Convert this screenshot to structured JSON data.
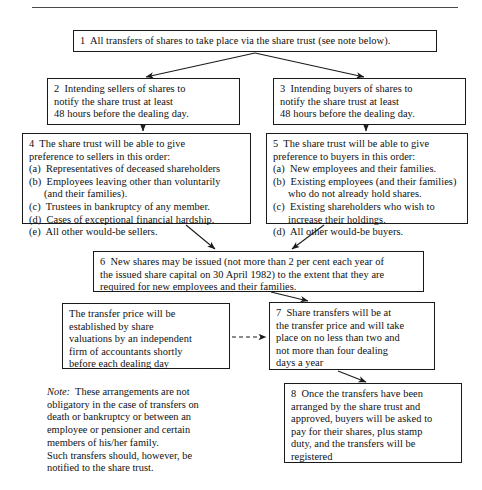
{
  "diagram": {
    "title_rule": "horizontal-rule",
    "boxes": {
      "box1": {
        "id": "1",
        "lines": [
          "1  All transfers of shares to take place via the share trust (see note below)."
        ]
      },
      "box2": {
        "id": "2",
        "lines": [
          "2  Intending sellers of shares to",
          "notify the share trust at least",
          "48 hours before the dealing day."
        ]
      },
      "box3": {
        "id": "3",
        "lines": [
          "3  Intending buyers of shares to",
          "notify the share trust at least",
          "48 hours before the dealing day."
        ]
      },
      "box4": {
        "id": "4",
        "lines": [
          "4  The share trust will be able to give",
          "preference to sellers in this order:",
          "(a)  Representatives of deceased shareholders",
          "(b)  Employees leaving other than voluntarily",
          "(and their families).",
          "(c)  Trustees in bankruptcy of any member.",
          "(d)  Cases of exceptional financial hardship.",
          "(e)  All other would-be sellers."
        ]
      },
      "box5": {
        "id": "5",
        "lines": [
          "5  The share trust will be able to give",
          "preference to buyers in this order:",
          "(a)  New employees and their families.",
          "(b)  Existing employees (and their families)",
          "who do not already hold shares.",
          "(c)  Existing shareholders who wish to",
          "increase their holdings.",
          "(d)  All other would-be buyers."
        ]
      },
      "box6": {
        "id": "6",
        "lines": [
          "6  New shares may be issued (not more than 2 per cent each year of",
          "the issued share capital on 30 April 1982) to the extent that they are",
          "required for new employees and their families."
        ]
      },
      "box_price": {
        "id": "",
        "lines": [
          "The transfer price will be",
          "established by share",
          "valuations by an independent",
          "firm of accountants shortly",
          "before each dealing day"
        ]
      },
      "box7": {
        "id": "7",
        "lines": [
          "7  Share transfers will be at",
          "the transfer price and will take",
          "place on no less than two and",
          "not more than four dealing",
          "days a year"
        ]
      },
      "box8": {
        "id": "8",
        "lines": [
          "8  Once the transfers have been",
          "arranged by the share trust and",
          "approved, buyers will be asked to",
          "pay for their shares, plus stamp",
          "duty, and the transfers will be",
          "registered"
        ]
      }
    },
    "note": {
      "label": "Note:",
      "lines": [
        "  These arrangements are not",
        "obligatory in the case of transfers on",
        "death or bankruptcy or between an",
        "employee or pensioner and certain",
        "members of his/her family.",
        "Such transfers should, however, be",
        "notified to the share trust."
      ]
    },
    "connectors": [
      {
        "name": "arrow-box1-to-box2",
        "style": "solid"
      },
      {
        "name": "arrow-box1-to-box3",
        "style": "solid"
      },
      {
        "name": "arrow-box2-to-box4",
        "style": "solid"
      },
      {
        "name": "arrow-box3-to-box5",
        "style": "solid"
      },
      {
        "name": "arrow-box4-to-box6",
        "style": "solid"
      },
      {
        "name": "arrow-box5-to-box6",
        "style": "solid"
      },
      {
        "name": "arrow-box6-to-box7",
        "style": "solid"
      },
      {
        "name": "arrow-price-to-box7",
        "style": "dashed"
      },
      {
        "name": "arrow-box7-to-box8",
        "style": "solid"
      }
    ],
    "colors": {
      "ink": "#111111",
      "border": "#1a1a1a",
      "rule": "#4a4a4a",
      "background": "#ffffff"
    }
  }
}
